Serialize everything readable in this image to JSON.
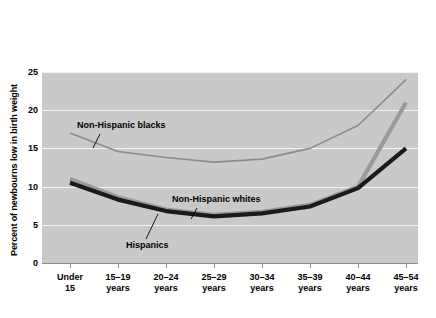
{
  "chart_data": {
    "type": "line",
    "title": "",
    "xlabel": "",
    "ylabel": "Percent of newbourns low in birth weight",
    "ylim": [
      0,
      25
    ],
    "yticks": [
      0,
      5,
      10,
      15,
      20,
      25
    ],
    "grid": true,
    "legend_position": "inline-annotations",
    "categories": [
      "Under 15",
      "15–19 years",
      "20–24 years",
      "25–29 years",
      "30–34 years",
      "35–39 years",
      "40–44 years",
      "45–54 years"
    ],
    "category_lines": [
      [
        "Under",
        "15"
      ],
      [
        "15–19",
        "years"
      ],
      [
        "20–24",
        "years"
      ],
      [
        "25–29",
        "years"
      ],
      [
        "30–34",
        "years"
      ],
      [
        "35–39",
        "years"
      ],
      [
        "40–44",
        "years"
      ],
      [
        "45–54",
        "years"
      ]
    ],
    "series": [
      {
        "name": "Non-Hispanic blacks",
        "color": "#8c8c8c",
        "width": 1.6,
        "values": [
          17.0,
          14.6,
          13.8,
          13.2,
          13.6,
          15.0,
          18.0,
          24.0
        ]
      },
      {
        "name": "Hispanics",
        "color": "#9a9a9a",
        "width": 4.2,
        "values": [
          11.0,
          8.6,
          7.0,
          6.3,
          6.7,
          7.6,
          10.0,
          21.0
        ]
      },
      {
        "name": "Non-Hispanic whites",
        "color": "#1a1a1a",
        "width": 4.2,
        "values": [
          10.5,
          8.3,
          6.8,
          6.1,
          6.5,
          7.4,
          9.8,
          15.0
        ]
      }
    ],
    "annotations": [
      {
        "text": "Non-Hispanic blacks",
        "target_series": "Non-Hispanic blacks"
      },
      {
        "text": "Non-Hispanic whites",
        "target_series": "Non-Hispanic whites"
      },
      {
        "text": "Hispanics",
        "target_series": "Hispanics"
      }
    ],
    "plot_background": "#c9c9c9",
    "gridline_color": "#f2f2f2"
  }
}
